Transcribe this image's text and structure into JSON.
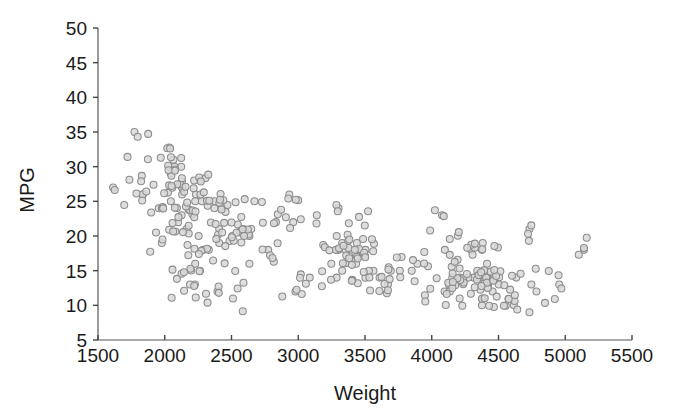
{
  "chart_data": {
    "type": "scatter",
    "title": "",
    "subtitle": "",
    "xlabel": "Weight",
    "ylabel": "MPG",
    "xlim": [
      1500,
      5500
    ],
    "ylim": [
      5,
      50
    ],
    "xticks": [
      1500,
      2000,
      2500,
      3000,
      3500,
      4000,
      4500,
      5000,
      5500
    ],
    "yticks": [
      5,
      10,
      15,
      20,
      25,
      30,
      35,
      40,
      45,
      50
    ],
    "grid": false,
    "legend": null,
    "legend_position": "none",
    "annotations": [],
    "marker": {
      "shape": "circle",
      "radius_px": 3.5,
      "fill": "#d8d8d8",
      "stroke": "#8c8c8c"
    },
    "series": [
      {
        "name": "cars",
        "x": [
          3504,
          3693,
          3436,
          3433,
          3449,
          4341,
          4354,
          4312,
          4425,
          3850,
          3563,
          3609,
          3761,
          3086,
          2372,
          2833,
          2774,
          2587,
          2130,
          1835,
          2672,
          2430,
          2375,
          2234,
          2648,
          4615,
          4376,
          4382,
          4732,
          2130,
          2264,
          2228,
          2046,
          1978,
          2634,
          3439,
          3329,
          3302,
          3288,
          4209,
          4464,
          4154,
          4096,
          4955,
          4746,
          5140,
          2962,
          2408,
          3282,
          3139,
          2220,
          2123,
          2074,
          2065,
          1773,
          1613,
          1834,
          1955,
          2278,
          2126,
          2254,
          2408,
          2226,
          4274,
          4385,
          4135,
          4129,
          3672,
          4633,
          4502,
          4456,
          4422,
          2330,
          3892,
          4098,
          4294,
          4077,
          2933,
          2511,
          2979,
          2189,
          2395,
          2288,
          2506,
          2164,
          2100,
          4376,
          4382,
          4732,
          2130,
          2264,
          2228,
          2046,
          1978,
          2634,
          3439,
          3329,
          3302,
          3288,
          4209
        ],
        "y": [
          18.0,
          15.0,
          18.0,
          16.0,
          17.0,
          15.0,
          14.0,
          14.0,
          14.0,
          15.0,
          15.0,
          14.0,
          15.0,
          14.0,
          24.0,
          22.0,
          18.0,
          21.0,
          27.0,
          26.0,
          25.0,
          24.0,
          25.0,
          26.0,
          21.0,
          10.0,
          10.0,
          11.0,
          9.0,
          27.0,
          28.0,
          25.0,
          25.0,
          19.0,
          16.0,
          17.0,
          19.0,
          18.0,
          14.0,
          14.0,
          14.0,
          14.0,
          12.0,
          13.0,
          13.0,
          18.0,
          22.0,
          19.0,
          18.0,
          23.0,
          28.0,
          30.0,
          30.0,
          31.0,
          35.0,
          27.0,
          26.0,
          24.0,
          25.0,
          23.0,
          20.0,
          21.0,
          13.0,
          14.0,
          15.0,
          12.0,
          13.0,
          13.0,
          14.0,
          13.0,
          12.0,
          13.0,
          18.0,
          16.0,
          18.0,
          18.0,
          23.0,
          26.0,
          11.0,
          12.0,
          13.0,
          12.0,
          18.0,
          20.0,
          21.0,
          22.0,
          18.0,
          19.0,
          21.0,
          26.0,
          15.0,
          16.0,
          29.0,
          24.0,
          20.0,
          19.0,
          15.0,
          24.0,
          20.0,
          11.0
        ]
      }
    ],
    "points_total": 398
  },
  "axes": {
    "x_title": "Weight",
    "y_title": "MPG",
    "x_tick_labels": [
      "1500",
      "2000",
      "2500",
      "3000",
      "3500",
      "4000",
      "4500",
      "5000",
      "5500"
    ],
    "y_tick_labels": [
      "5",
      "10",
      "15",
      "20",
      "25",
      "30",
      "35",
      "40",
      "45",
      "50"
    ]
  },
  "colors": {
    "background": "#ffffff",
    "marker_fill": "#d8d8d8",
    "marker_stroke": "#8c8c8c",
    "axis": "#555555",
    "text": "#1a1a1a"
  }
}
